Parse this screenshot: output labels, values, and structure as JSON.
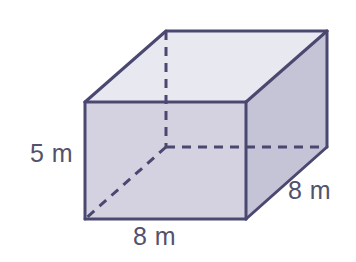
{
  "figure": {
    "name": "rectangular-prism",
    "background_color": "#ffffff"
  },
  "solid": {
    "front_face_color": "#d4d2e0",
    "right_face_color": "#c5c3d6",
    "top_face_color": "#e8e8f0",
    "edge_color": "#4a4870",
    "hidden_edge_color": "#4a4870",
    "edge_width": 3,
    "hidden_edge_width": 3,
    "hidden_edge_dash": "9 7",
    "vertices": {
      "front_top_left": [
        85,
        102
      ],
      "front_top_right": [
        246,
        102
      ],
      "front_bottom_right": [
        246,
        219
      ],
      "front_bottom_left": [
        85,
        219
      ],
      "back_top_left": [
        166,
        31
      ],
      "back_top_right": [
        327,
        31
      ],
      "back_bottom_right": [
        327,
        147
      ],
      "back_bottom_left": [
        166,
        147
      ]
    }
  },
  "labels": {
    "text_color": "#53526b",
    "height": "5 m",
    "width": "8 m",
    "depth": "8 m"
  },
  "chart_data": {
    "type": "diagram",
    "shape": "rectangular prism",
    "title": "",
    "dimensions": [
      {
        "name": "height",
        "value": 5,
        "unit": "m",
        "label": "5 m",
        "position": "left"
      },
      {
        "name": "width",
        "value": 8,
        "unit": "m",
        "label": "8 m",
        "position": "bottom"
      },
      {
        "name": "depth",
        "value": 8,
        "unit": "m",
        "label": "8 m",
        "position": "right"
      }
    ]
  }
}
